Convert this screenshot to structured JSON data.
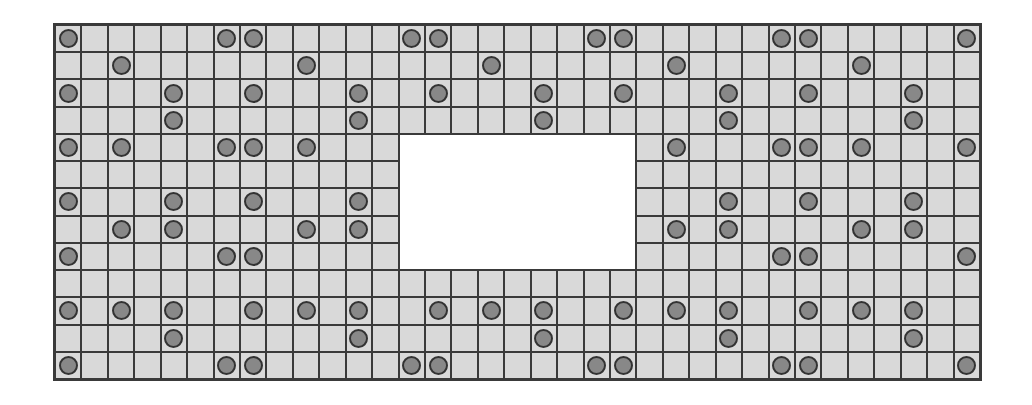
{
  "board": {
    "columns": 35,
    "rows": 13,
    "colors": {
      "cell": "#d9d9d9",
      "grid_line": "#3a3a3a",
      "peg_fill": "#888888",
      "peg_stroke": "#333333",
      "hole": "#ffffff"
    },
    "hole": {
      "row_start": 4,
      "row_end": 8,
      "col_start": 13,
      "col_end": 21
    },
    "pegs_by_row": [
      [
        0,
        6,
        7,
        13,
        14,
        20,
        21,
        27,
        28,
        34
      ],
      [
        2,
        9,
        16,
        23,
        30
      ],
      [
        0,
        4,
        7,
        11,
        14,
        18,
        21,
        25,
        28,
        32
      ],
      [
        4,
        11,
        18,
        25,
        32
      ],
      [
        0,
        2,
        6,
        7,
        9,
        23,
        27,
        28,
        30,
        34
      ],
      [],
      [
        0,
        4,
        7,
        11,
        25,
        28,
        32
      ],
      [
        2,
        4,
        9,
        11,
        23,
        25,
        30,
        32
      ],
      [
        0,
        6,
        7,
        27,
        28,
        34
      ],
      [],
      [
        0,
        2,
        4,
        7,
        9,
        11,
        14,
        16,
        18,
        21,
        23,
        25,
        28,
        30,
        32
      ],
      [
        4,
        11,
        18,
        25,
        32
      ],
      [
        0,
        6,
        7,
        13,
        14,
        20,
        21,
        27,
        28,
        34
      ]
    ]
  }
}
